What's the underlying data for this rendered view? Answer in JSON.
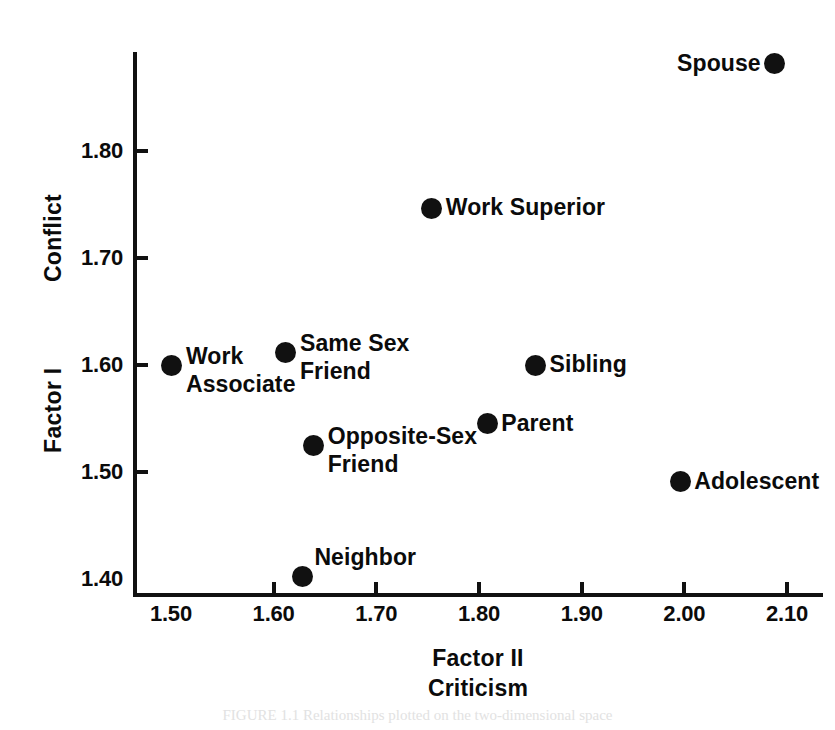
{
  "chart_data": {
    "type": "scatter",
    "title": "",
    "xlabel": "Factor II Criticism",
    "xlabel_lines": [
      "Factor II",
      "Criticism"
    ],
    "ylabel": "Factor I Conflict",
    "ylabel_lines": [
      "Conflict",
      "Factor I"
    ],
    "xlim": [
      1.465,
      2.135
    ],
    "ylim": [
      1.385,
      1.893
    ],
    "xticks": [
      "1.50",
      "1.60",
      "1.70",
      "1.80",
      "1.90",
      "2.00",
      "2.10"
    ],
    "xtick_values": [
      1.5,
      1.6,
      1.7,
      1.8,
      1.9,
      2.0,
      2.1
    ],
    "yticks": [
      "1.40",
      "1.50",
      "1.60",
      "1.70",
      "1.80"
    ],
    "ytick_values": [
      1.4,
      1.5,
      1.6,
      1.7,
      1.8
    ],
    "grid": false,
    "legend": false,
    "marker": "filled-circle",
    "marker_color": "#111111",
    "points": [
      {
        "label": "Spouse",
        "x": 2.088,
        "y": 1.882,
        "label_pos": "left"
      },
      {
        "label": "Work Superior",
        "x": 1.754,
        "y": 1.747,
        "label_pos": "right"
      },
      {
        "label": "Same Sex Friend",
        "x": 1.612,
        "y": 1.612,
        "label_pos": "right",
        "label_lines": [
          "Same Sex",
          "Friend"
        ]
      },
      {
        "label": "Work Associate",
        "x": 1.501,
        "y": 1.6,
        "label_pos": "right",
        "label_lines": [
          "Work",
          "Associate"
        ]
      },
      {
        "label": "Sibling",
        "x": 1.855,
        "y": 1.6,
        "label_pos": "right"
      },
      {
        "label": "Parent",
        "x": 1.808,
        "y": 1.545,
        "label_pos": "right"
      },
      {
        "label": "Opposite-Sex Friend",
        "x": 1.639,
        "y": 1.525,
        "label_pos": "right",
        "label_lines": [
          "Opposite-Sex",
          "Friend"
        ]
      },
      {
        "label": "Adolescent",
        "x": 1.996,
        "y": 1.491,
        "label_pos": "right"
      },
      {
        "label": "Neighbor",
        "x": 1.628,
        "y": 1.402,
        "label_pos": "above-right"
      }
    ]
  },
  "axis": {
    "y_title_upper": "Conflict",
    "y_title_lower": "Factor I",
    "x_title_line1": "Factor II",
    "x_title_line2": "Criticism"
  },
  "caption": "FIGURE 1.1  Relationships plotted on the two-dimensional space"
}
